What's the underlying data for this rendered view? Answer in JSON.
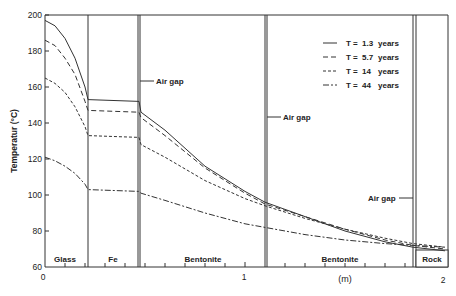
{
  "chart_data": {
    "type": "line",
    "title": "",
    "xlabel": "(m)",
    "ylabel": "Temperatur (°C)",
    "xlim": [
      0,
      2
    ],
    "ylim": [
      60,
      200
    ],
    "x_ticks": [
      "0",
      "1",
      "2"
    ],
    "y_ticks": [
      "60",
      "80",
      "100",
      "120",
      "140",
      "160",
      "180",
      "200"
    ],
    "grid": false,
    "legend_position": "upper right",
    "regions": [
      {
        "label": "Glass",
        "x_start": 0,
        "x_end": 0.215
      },
      {
        "label": "Fe",
        "x_start": 0.215,
        "x_end": 0.47
      },
      {
        "label": "Bentonite",
        "x_start": 0.48,
        "x_end": 1.1
      },
      {
        "label": "Bentonite",
        "x_start": 1.11,
        "x_end": 1.84
      },
      {
        "label": "Rock",
        "x_start": 1.86,
        "x_end": 2.0
      }
    ],
    "annotations": [
      "Air gap",
      "Air gap",
      "Air gap"
    ],
    "series": [
      {
        "name": "T = 1.3 years",
        "style": "solid",
        "x": [
          0,
          0.05,
          0.1,
          0.15,
          0.2,
          0.215,
          0.47,
          0.48,
          0.6,
          0.8,
          1.0,
          1.1,
          1.3,
          1.5,
          1.7,
          1.84,
          2.0
        ],
        "y": [
          197,
          194,
          187,
          176,
          160,
          153,
          152,
          146,
          136,
          116,
          102,
          96,
          88,
          80,
          74,
          71,
          69
        ]
      },
      {
        "name": "T = 5.7 years",
        "style": "long-dash",
        "x": [
          0,
          0.05,
          0.1,
          0.15,
          0.2,
          0.215,
          0.47,
          0.48,
          0.6,
          0.8,
          1.0,
          1.1,
          1.3,
          1.5,
          1.7,
          1.84,
          2.0
        ],
        "y": [
          186,
          183,
          176,
          167,
          152,
          147,
          146,
          143,
          133,
          115,
          101,
          95,
          88,
          81,
          75,
          72,
          70
        ]
      },
      {
        "name": "T = 14 years",
        "style": "short-dash",
        "x": [
          0,
          0.05,
          0.1,
          0.15,
          0.2,
          0.215,
          0.47,
          0.48,
          0.6,
          0.8,
          1.0,
          1.1,
          1.3,
          1.5,
          1.7,
          1.84,
          2.0
        ],
        "y": [
          165,
          162,
          157,
          149,
          138,
          133,
          132,
          128,
          121,
          108,
          98,
          94,
          87,
          81,
          76,
          73,
          71
        ]
      },
      {
        "name": "T = 44 years",
        "style": "dash-dot",
        "x": [
          0,
          0.05,
          0.1,
          0.15,
          0.2,
          0.215,
          0.47,
          0.48,
          0.6,
          0.8,
          1.0,
          1.1,
          1.3,
          1.5,
          1.7,
          1.84,
          2.0
        ],
        "y": [
          121,
          119,
          116,
          112,
          106,
          103,
          102,
          101,
          97,
          90,
          84,
          82,
          78,
          75,
          73,
          72,
          71
        ]
      }
    ]
  },
  "legend": {
    "items": [
      {
        "t": "T =",
        "value": "1.3",
        "unit": "years"
      },
      {
        "t": "T =",
        "value": "5.7",
        "unit": "years"
      },
      {
        "t": "T =",
        "value": "14",
        "unit": "years"
      },
      {
        "t": "T =",
        "value": "44",
        "unit": "years"
      }
    ]
  },
  "labels": {
    "ylabel": "Temperatur (°C)",
    "xlabel": "(m)",
    "air_gap_1": "Air gap",
    "air_gap_2": "Air gap",
    "air_gap_3": "Air gap",
    "region_glass": "Glass",
    "region_fe": "Fe",
    "region_bentonite_1": "Bentonite",
    "region_bentonite_2": "Bentonite",
    "region_rock": "Rock"
  },
  "ticks": {
    "x": [
      "0",
      "1",
      "2"
    ],
    "y": [
      "200",
      "180",
      "160",
      "140",
      "120",
      "100",
      "80",
      "60"
    ]
  }
}
